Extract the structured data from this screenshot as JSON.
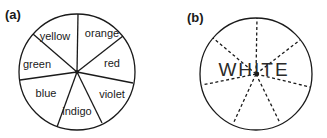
{
  "panel_a": {
    "label": "(a)",
    "segments": [
      {
        "name": "yellow",
        "x": 55,
        "y": 40
      },
      {
        "name": "orange",
        "x": 101,
        "y": 37
      },
      {
        "name": "red",
        "x": 111,
        "y": 67
      },
      {
        "name": "violet",
        "x": 111,
        "y": 98
      },
      {
        "name": "indigo",
        "x": 75,
        "y": 115
      },
      {
        "name": "blue",
        "x": 46,
        "y": 96
      },
      {
        "name": "green",
        "x": 37,
        "y": 67
      }
    ]
  },
  "panel_b": {
    "label": "(b)",
    "center_text": "WHITE"
  },
  "colors": {
    "ink": "#1a1a1a",
    "background": "#ffffff"
  }
}
